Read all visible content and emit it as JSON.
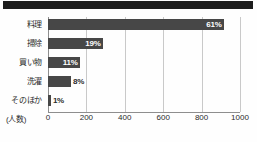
{
  "chart_data": {
    "type": "bar",
    "orientation": "horizontal",
    "title": "",
    "xlabel": "(人数)",
    "ylabel": "",
    "categories": [
      "料理",
      "掃除",
      "買い物",
      "洗濯",
      "そのほか"
    ],
    "values": [
      61,
      19,
      11,
      8,
      1
    ],
    "value_labels": [
      "61%",
      "19%",
      "11%",
      "8%",
      "1%"
    ],
    "bar_counts": [
      915,
      285,
      165,
      120,
      15
    ],
    "xlim": [
      0,
      1000
    ],
    "xticks": [
      0,
      200,
      400,
      600,
      800,
      1000
    ],
    "xtick_labels": [
      "0",
      "200",
      "400",
      "600",
      "800",
      "1000"
    ],
    "grid": true,
    "legend": null,
    "bar_color": "#474747",
    "grid_color": "#c9c9c9",
    "axis_color": "#8e8e8e",
    "value_label_color": "#ffffff",
    "value_label_color_outside": "#2b2b2b"
  },
  "page": {
    "header_band_color": "#1d1d1d",
    "background_color": "#fefefe"
  }
}
